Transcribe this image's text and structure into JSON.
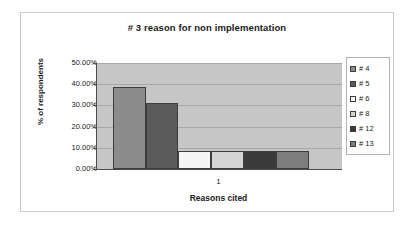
{
  "chart_data": {
    "type": "bar",
    "title": "# 3 reason for non implementation",
    "xlabel": "Reasons cited",
    "ylabel": "% of respondents",
    "categories": [
      "1"
    ],
    "ylim": [
      0,
      50
    ],
    "ytick_labels": [
      "50.00%",
      "40.00%",
      "30.00%",
      "20.00%",
      "10.00%",
      "0.00%"
    ],
    "ytick_values": [
      50,
      40,
      30,
      20,
      10,
      0
    ],
    "grid": true,
    "legend_position": "right",
    "plot_background": "#C6C6C6",
    "series": [
      {
        "name": "# 4",
        "values": [
          38.7
        ],
        "color": "#8C8C8C"
      },
      {
        "name": "# 5",
        "values": [
          31.1
        ],
        "color": "#5A5A5A"
      },
      {
        "name": "# 6",
        "values": [
          8.3
        ],
        "color": "#F5F5F5"
      },
      {
        "name": "# 8",
        "values": [
          8.3
        ],
        "color": "#D4D4D4"
      },
      {
        "name": "# 12",
        "values": [
          8.3
        ],
        "color": "#3A3A3A"
      },
      {
        "name": "# 13",
        "values": [
          8.6
        ],
        "color": "#7E7E7E"
      }
    ]
  }
}
